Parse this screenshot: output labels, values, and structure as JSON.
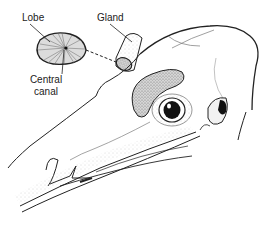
{
  "figure": {
    "labels": {
      "lobe": "Lobe",
      "gland": "Gland",
      "central_canal_line1": "Central",
      "central_canal_line2": "canal"
    }
  },
  "colors": {
    "ink": "#222222",
    "stipple": "#9a9a9a",
    "gland_fill": "#c8c8c8",
    "eye": "#111111",
    "background": "#ffffff"
  }
}
